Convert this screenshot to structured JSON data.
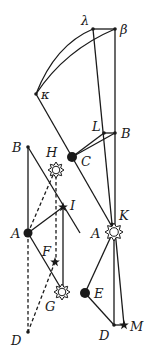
{
  "figure": {
    "upper": {
      "labels": {
        "lambda": "λ",
        "beta": "β",
        "kappa": "κ",
        "L": "L",
        "B": "B",
        "C": "C",
        "K": "K",
        "A": "A",
        "E": "E",
        "D": "D",
        "M": "M"
      }
    },
    "left": {
      "labels": {
        "B": "B",
        "H": "H",
        "I": "I",
        "A": "A",
        "F": "F",
        "G": "G",
        "D": "D"
      }
    },
    "symbols": {
      "sun": "sun-symbol",
      "star": "star-symbol",
      "earth": "filled-dot",
      "point": "small-dot"
    },
    "colors": {
      "ink": "#1a1a1a",
      "background": "#ffffff"
    }
  }
}
